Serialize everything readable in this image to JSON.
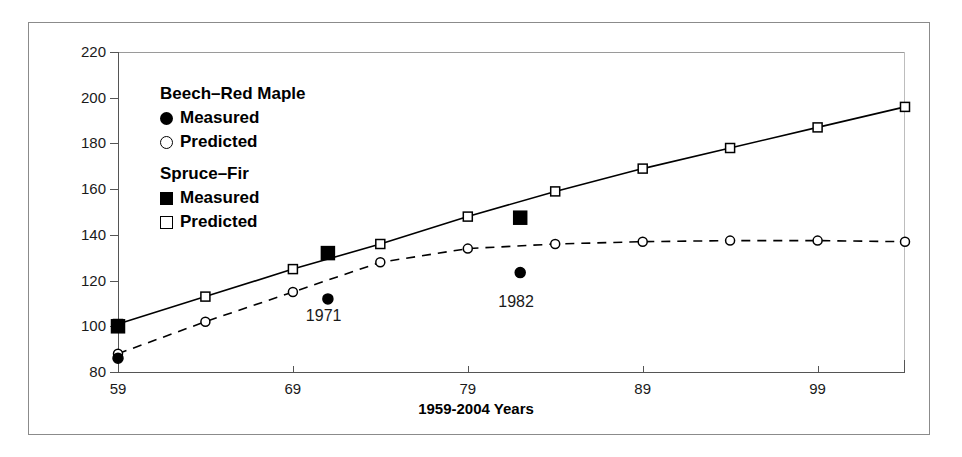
{
  "chart_data": {
    "type": "line",
    "title": "",
    "xlabel": "1959-2004 Years",
    "ylabel": "Basal Area ( square feet )",
    "xlim": [
      59,
      104
    ],
    "ylim": [
      80,
      220
    ],
    "xticks": [
      59,
      69,
      79,
      89,
      99
    ],
    "yticks": [
      80,
      100,
      120,
      140,
      160,
      180,
      200,
      220
    ],
    "grid": false,
    "legend_position": "upper-left-inside",
    "legend_groups": [
      {
        "heading": "Beech–Red Maple",
        "entries": [
          {
            "label": "Measured",
            "marker": "circle-filled"
          },
          {
            "label": "Predicted",
            "marker": "circle-open"
          }
        ]
      },
      {
        "heading": "Spruce–Fir",
        "entries": [
          {
            "label": "Measured",
            "marker": "square-filled"
          },
          {
            "label": "Predicted",
            "marker": "square-open"
          }
        ]
      }
    ],
    "series": [
      {
        "name": "Spruce-Fir Predicted",
        "marker": "square-open",
        "line": "solid",
        "x": [
          59,
          64,
          69,
          74,
          79,
          84,
          89,
          94,
          99,
          104
        ],
        "values": [
          101,
          113,
          125,
          136,
          148,
          159,
          169,
          178,
          187,
          196
        ]
      },
      {
        "name": "Beech-Red Maple Predicted",
        "marker": "circle-open",
        "line": "dashed",
        "x": [
          59,
          64,
          69,
          74,
          79,
          84,
          89,
          94,
          99,
          104
        ],
        "values": [
          88,
          102,
          115,
          128,
          134,
          136,
          137,
          137.5,
          137.5,
          137
        ]
      },
      {
        "name": "Spruce-Fir Measured",
        "marker": "square-filled",
        "line": "none",
        "x": [
          59,
          71,
          82
        ],
        "values": [
          100,
          132,
          147.5
        ]
      },
      {
        "name": "Beech-Red Maple Measured",
        "marker": "circle-filled",
        "line": "none",
        "x": [
          59,
          71,
          82
        ],
        "values": [
          86,
          112,
          123.5
        ]
      }
    ],
    "annotations": [
      {
        "text": "1971",
        "x": 71,
        "y": 104
      },
      {
        "text": "1982",
        "x": 82,
        "y": 110
      }
    ]
  }
}
